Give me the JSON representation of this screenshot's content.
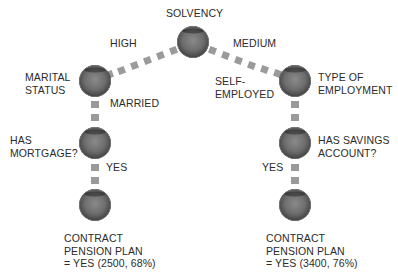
{
  "diagram": {
    "type": "decision-tree",
    "connector_color": "#9a9a9a",
    "node_color": "#555555",
    "root": {
      "label": "SOLVENCY"
    },
    "edges": {
      "root_left": "HIGH",
      "root_right": "MEDIUM",
      "left_down": "MARRIED",
      "right_down": [
        "SELF-",
        "EMPLOYED"
      ],
      "left_bottom": "YES",
      "right_bottom": "YES"
    },
    "left_branch": {
      "level1": [
        "MARITAL",
        "STATUS"
      ],
      "level2": [
        "HAS",
        "MORTGAGE?"
      ],
      "leaf": [
        "CONTRACT",
        "PENSION PLAN",
        "= YES (2500, 68%)"
      ]
    },
    "right_branch": {
      "level1": [
        "TYPE OF",
        "EMPLOYMENT"
      ],
      "level2": [
        "HAS SAVINGS",
        "ACCOUNT?"
      ],
      "leaf": [
        "CONTRACT",
        "PENSION PLAN",
        "= YES (3400, 76%)"
      ]
    }
  }
}
